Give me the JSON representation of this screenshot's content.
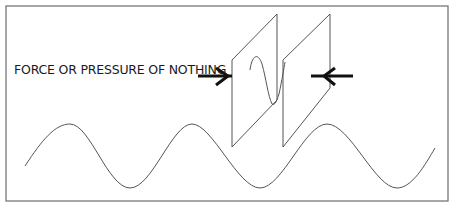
{
  "diagram": {
    "label": "FORCE OR PRESSURE OF NOTHING",
    "elements": [
      {
        "name": "frame",
        "description": "rectangular border"
      },
      {
        "name": "left-plate",
        "description": "parallelogram plate in perspective"
      },
      {
        "name": "right-plate",
        "description": "parallelogram plate in perspective"
      },
      {
        "name": "left-arrow",
        "direction": "right"
      },
      {
        "name": "right-arrow",
        "direction": "left"
      },
      {
        "name": "wave-between-plates",
        "description": "short wave between plates"
      },
      {
        "name": "long-wave",
        "description": "sine wave across the bottom"
      }
    ],
    "colors": {
      "line": "#555555",
      "arrow": "#111111",
      "frame": "#777777",
      "text": "#1a1a1a"
    }
  }
}
